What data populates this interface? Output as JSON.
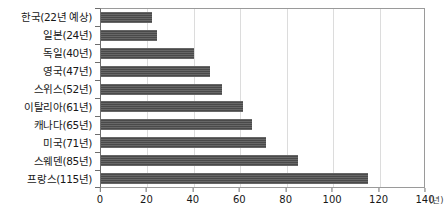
{
  "chart_data": {
    "type": "bar",
    "orientation": "horizontal",
    "title": "",
    "xlabel": "",
    "ylabel": "",
    "unit_label": "(년)",
    "xlim": [
      0,
      140
    ],
    "xticks": [
      0,
      20,
      40,
      60,
      80,
      100,
      120,
      140
    ],
    "grid": true,
    "legend": false,
    "bar_color": "#4a4a4a",
    "categories": [
      "한국(22년 예상)",
      "일본(24년)",
      "독일(40년)",
      "영국(47년)",
      "스위스(52년)",
      "이탈리아(61년)",
      "캐나다(65년)",
      "미국(71년)",
      "스웨덴(85년)",
      "프랑스(115년)"
    ],
    "values": [
      22,
      24,
      40,
      47,
      52,
      61,
      65,
      71,
      85,
      115
    ]
  }
}
